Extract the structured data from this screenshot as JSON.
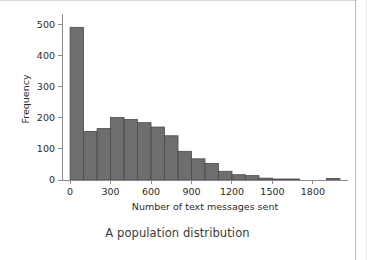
{
  "figure": {
    "caption": "A population distribution",
    "background_color": "#ffffff",
    "bar_fill_color": "#6e6e6e",
    "bar_edge_color": "#4a4a4a",
    "axis_color": "#8c8c8c"
  },
  "chart_data": {
    "type": "bar",
    "title": "",
    "subtitle": "",
    "xlabel": "Number of text messages sent",
    "ylabel": "Frequency",
    "xlim": [
      -60,
      2060
    ],
    "ylim": [
      0,
      520
    ],
    "xticks": [
      0,
      300,
      600,
      900,
      1200,
      1500,
      1800
    ],
    "xticklabels": [
      "0",
      "300",
      "600",
      "900",
      "1200",
      "1500",
      "1800"
    ],
    "yticks": [
      0,
      100,
      200,
      300,
      400,
      500
    ],
    "yticklabels": [
      "0",
      "100",
      "200",
      "300",
      "400",
      "500"
    ],
    "grid": false,
    "legend": null,
    "bin_width": 100,
    "bin_edges": [
      0,
      100,
      200,
      300,
      400,
      500,
      600,
      700,
      800,
      900,
      1000,
      1100,
      1200,
      1300,
      1400,
      1500,
      1600,
      1700,
      1800,
      1900,
      2000
    ],
    "categories": [
      "0-100",
      "100-200",
      "200-300",
      "300-400",
      "400-500",
      "500-600",
      "600-700",
      "700-800",
      "800-900",
      "900-1000",
      "1000-1100",
      "1100-1200",
      "1200-1300",
      "1300-1400",
      "1400-1500",
      "1500-1600",
      "1600-1700",
      "1700-1800",
      "1800-1900",
      "1900-2000"
    ],
    "values": [
      490,
      156,
      165,
      201,
      194,
      184,
      170,
      142,
      92,
      68,
      53,
      28,
      17,
      14,
      6,
      3,
      2,
      0,
      0,
      5
    ]
  }
}
